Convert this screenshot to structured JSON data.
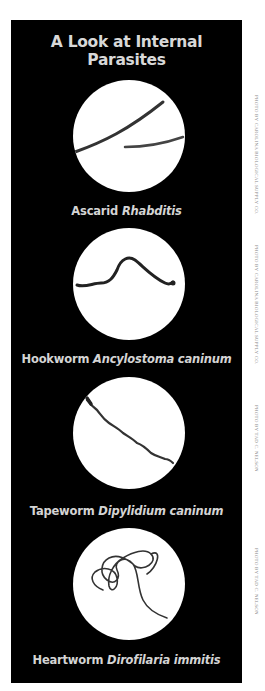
{
  "title": "A Look at Internal Parasites",
  "colors": {
    "panel": "#000000",
    "text": "#d6d6d6",
    "circle": "#ffffff",
    "worm": "#333333",
    "credit": "#8a8a8a"
  },
  "parasites": [
    {
      "common": "Ascarid",
      "scientific": "Rhabditis",
      "credit": "Photo by Carolina Biological Supply Co."
    },
    {
      "common": "Hookworm",
      "scientific": "Ancylostoma caninum",
      "credit": "Photo by Carolina Biological Supply Co."
    },
    {
      "common": "Tapeworm",
      "scientific": "Dipylidium caninum",
      "credit": "Photo by Tad C. Nelson"
    },
    {
      "common": "Heartworm",
      "scientific": "Dirofilaria immitis",
      "credit": "Photo by Tad C. Nelson"
    }
  ]
}
